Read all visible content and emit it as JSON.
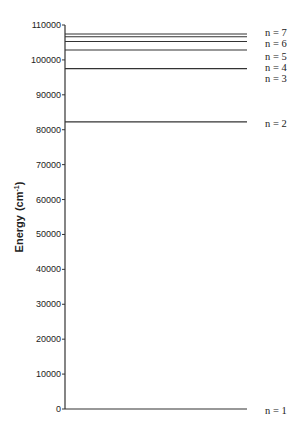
{
  "chart_data": {
    "type": "line",
    "title": "",
    "xlabel": "",
    "ylabel": "Energy (cm-1)",
    "ylabel_main": "Energy",
    "ylabel_unit_base": "(cm",
    "ylabel_unit_sup": "-1",
    "ylabel_unit_close": ")",
    "ylim": [
      0,
      110000
    ],
    "yticks": [
      0,
      10000,
      20000,
      30000,
      40000,
      50000,
      60000,
      70000,
      80000,
      90000,
      100000,
      110000
    ],
    "grid": false,
    "legend": null,
    "levels": [
      {
        "label": "n = 1",
        "energy": 0
      },
      {
        "label": "n = 2",
        "energy": 82259
      },
      {
        "label": "n = 3",
        "energy": 97492
      },
      {
        "label": "n = 4",
        "energy": 102824
      },
      {
        "label": "n = 5",
        "energy": 105292
      },
      {
        "label": "n = 6",
        "energy": 106632
      },
      {
        "label": "n = 7",
        "energy": 107440
      }
    ]
  },
  "layout": {
    "axis_x": 65,
    "line_end_x": 247,
    "y_zero_px": 409,
    "y_max_px": 25,
    "label_x": 265,
    "label_y": [
      411,
      124,
      79,
      68,
      57,
      44,
      33
    ],
    "line_color": "#333333"
  }
}
